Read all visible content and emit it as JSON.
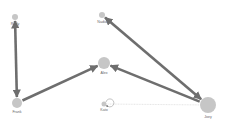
{
  "graph": {
    "background": "#ffffff",
    "node_color": "#c6c6c6",
    "edge_color": "#6e6e6e",
    "faint_edge_color": "#d4d4d4",
    "nodes": [
      {
        "id": "rudy",
        "label": "Rudy",
        "x": 15,
        "y": 17,
        "r": 3
      },
      {
        "id": "nadia",
        "label": "Nadia",
        "x": 102,
        "y": 15,
        "r": 3
      },
      {
        "id": "alex",
        "label": "Alex",
        "x": 104,
        "y": 63,
        "r": 6
      },
      {
        "id": "frank",
        "label": "Frank",
        "x": 17,
        "y": 103,
        "r": 5
      },
      {
        "id": "kato",
        "label": "Kato",
        "x": 104,
        "y": 104,
        "r": 2.5
      },
      {
        "id": "joey",
        "label": "Joey",
        "x": 208,
        "y": 105,
        "r": 8
      }
    ],
    "edges": [
      {
        "from": "rudy",
        "to": "frank",
        "bidirectional": true,
        "style": "solid"
      },
      {
        "from": "frank",
        "to": "alex",
        "bidirectional": false,
        "style": "solid"
      },
      {
        "from": "joey",
        "to": "alex",
        "bidirectional": false,
        "style": "solid"
      },
      {
        "from": "joey",
        "to": "nadia",
        "bidirectional": true,
        "style": "solid"
      },
      {
        "from": "joey",
        "to": "kato",
        "bidirectional": false,
        "style": "faint"
      },
      {
        "from": "kato",
        "to": "kato",
        "bidirectional": false,
        "style": "self-loop"
      }
    ]
  }
}
